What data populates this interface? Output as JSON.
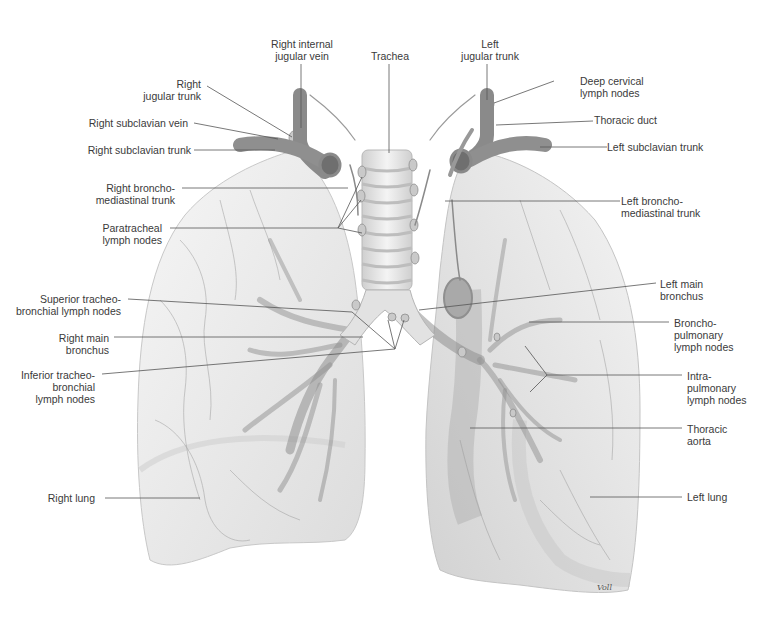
{
  "figure": {
    "signature": "Voll",
    "colors": {
      "background": "#ffffff",
      "lung_fill": "#eeeeee",
      "lung_shadow": "#d6d6d6",
      "vessel": "#7a7a7a",
      "vein": "#8a8a8a",
      "trachea": "#e8e8e8",
      "leader_line": "#555555",
      "label_text": "#3a3a3a"
    }
  },
  "labels": {
    "right_internal_jugular_vein": {
      "line1": "Right internal",
      "line2": "jugular vein"
    },
    "trachea": {
      "line1": "Trachea"
    },
    "left_jugular_trunk": {
      "line1": "Left",
      "line2": "jugular trunk"
    },
    "right_jugular_trunk": {
      "line1": "Right",
      "line2": "jugular trunk"
    },
    "deep_cervical_lymph_nodes": {
      "line1": "Deep cervical",
      "line2": "lymph nodes"
    },
    "right_subclavian_vein": {
      "line1": "Right subclavian vein"
    },
    "thoracic_duct": {
      "line1": "Thoracic duct"
    },
    "right_subclavian_trunk": {
      "line1": "Right subclavian trunk"
    },
    "left_subclavian_trunk": {
      "line1": "Left subclavian trunk"
    },
    "right_bronchomediastinal_trunk": {
      "line1": "Right broncho-",
      "line2": "mediastinal trunk"
    },
    "left_bronchomediastinal_trunk": {
      "line1": "Left broncho-",
      "line2": "mediastinal trunk"
    },
    "paratracheal_lymph_nodes": {
      "line1": "Paratracheal",
      "line2": "lymph nodes"
    },
    "superior_tracheobronchial_lymph_nodes": {
      "line1": "Superior tracheo-",
      "line2": "bronchial lymph nodes"
    },
    "left_main_bronchus": {
      "line1": "Left main",
      "line2": "bronchus"
    },
    "right_main_bronchus": {
      "line1": "Right main",
      "line2": "bronchus"
    },
    "bronchopulmonary_lymph_nodes": {
      "line1": "Broncho-",
      "line2": "pulmonary",
      "line3": "lymph nodes"
    },
    "inferior_tracheobronchial_lymph_nodes": {
      "line1": "Inferior tracheo-",
      "line2": "bronchial",
      "line3": "lymph nodes"
    },
    "intrapulmonary_lymph_nodes": {
      "line1": "Intra-",
      "line2": "pulmonary",
      "line3": "lymph nodes"
    },
    "thoracic_aorta": {
      "line1": "Thoracic",
      "line2": "aorta"
    },
    "right_lung": {
      "line1": "Right lung"
    },
    "left_lung": {
      "line1": "Left lung"
    }
  }
}
